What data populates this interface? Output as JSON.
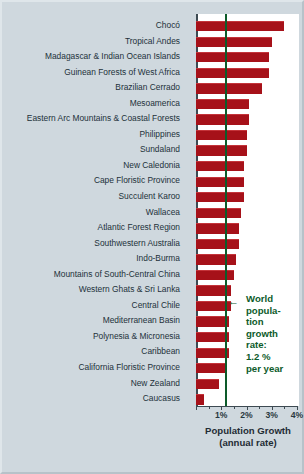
{
  "chart_data": {
    "type": "bar",
    "orientation": "horizontal",
    "title": "Population Growth",
    "subtitle": "(annual rate)",
    "xlabel": "Population Growth (annual rate)",
    "ylabel": "",
    "xlim": [
      0,
      4
    ],
    "xtick_labels": [
      "1%",
      "2%",
      "3%",
      "4%"
    ],
    "xtick_values": [
      1,
      2,
      3,
      4
    ],
    "minor_tick_step": 0.5,
    "grid": false,
    "legend": "none",
    "units": "percent per year",
    "bar_color": "#a61119",
    "reference_line": {
      "label": "World population growth rate: 1.2 % per year",
      "value": 1.2,
      "color": "#0d5b2a",
      "annotation_lines": [
        "World",
        "popula-",
        "tion",
        "growth",
        "rate:",
        "1.2 %",
        "per year"
      ]
    },
    "categories": [
      "Chocó",
      "Tropical Andes",
      "Madagascar & Indian Ocean Islands",
      "Guinean Forests of West Africa",
      "Brazilian Cerrado",
      "Mesoamerica",
      "Eastern Arc Mountains & Coastal Forests",
      "Philippines",
      "Sundaland",
      "New Caledonia",
      "Cape Floristic Province",
      "Succulent Karoo",
      "Wallacea",
      "Atlantic Forest Region",
      "Southwestern Australia",
      "Indo-Burma",
      "Mountains of South-Central China",
      "Western Ghats & Sri Lanka",
      "Central Chile",
      "Mediterranean Basin",
      "Polynesia & Micronesia",
      "Caribbean",
      "California Floristic Province",
      "New Zealand",
      "Caucasus"
    ],
    "values": [
      3.5,
      3.0,
      2.9,
      2.9,
      2.6,
      2.1,
      2.1,
      2.0,
      2.0,
      1.9,
      1.9,
      1.9,
      1.8,
      1.7,
      1.7,
      1.6,
      1.5,
      1.4,
      1.4,
      1.3,
      1.3,
      1.3,
      1.2,
      0.9,
      0.3
    ]
  }
}
